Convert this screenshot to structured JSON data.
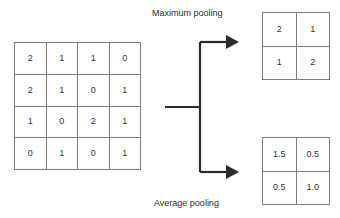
{
  "diagram": {
    "labels": {
      "maximum_pooling": "Maximum pooling",
      "average_pooling": "Average pooling"
    },
    "colors": {
      "grid_line": "#7d7d7d",
      "text": "#333333",
      "arrow": "#2b2b2b",
      "background": "#ffffff"
    },
    "input_matrix": {
      "name": "input feature map",
      "rows": 4,
      "cols": 4,
      "values": [
        [
          "2",
          "1",
          "1",
          "0"
        ],
        [
          "2",
          "1",
          "0",
          "1"
        ],
        [
          "1",
          "0",
          "2",
          "1"
        ],
        [
          "0",
          "1",
          "0",
          "1"
        ]
      ]
    },
    "max_output": {
      "name": "maximum pooling result",
      "rows": 2,
      "cols": 2,
      "values": [
        [
          "2",
          "1"
        ],
        [
          "1",
          "2"
        ]
      ]
    },
    "avg_output": {
      "name": "average pooling result",
      "rows": 2,
      "cols": 2,
      "values": [
        [
          "1.5",
          "0.5"
        ],
        [
          "0.5",
          "1.0"
        ]
      ]
    },
    "connector": {
      "name": "branching arrow",
      "arrows": [
        "arrow-to-maximum-pooling",
        "arrow-to-average-pooling"
      ]
    }
  }
}
